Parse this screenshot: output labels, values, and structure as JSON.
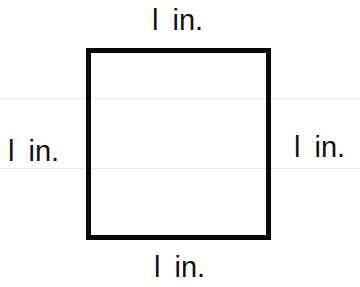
{
  "diagram": {
    "shape": "square",
    "colors": {
      "stroke": "#0a0a0a",
      "text": "#111111",
      "background": "#ffffff"
    },
    "labels": {
      "top": "l in.",
      "left": "l in.",
      "right": "l in.",
      "bottom": "l in."
    }
  }
}
